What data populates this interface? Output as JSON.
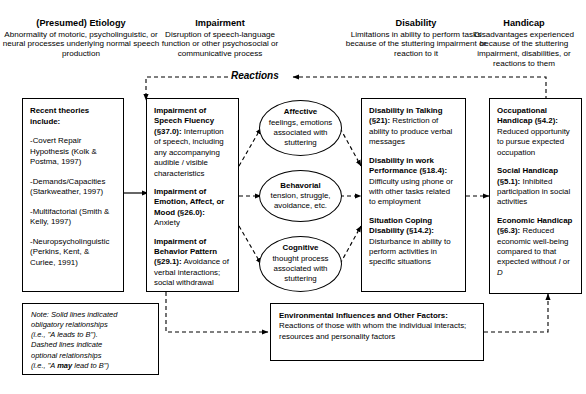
{
  "diagram": {
    "reactions_label": "Reactions",
    "columns": [
      {
        "id": "etiology",
        "title": "(Presumed) Etiology",
        "subtitle": "Abnormality of motoric, psycholinguistic, or neural processes underlying normal speech production"
      },
      {
        "id": "impairment",
        "title": "Impairment",
        "subtitle": "Disruption of speech-language function or other psychosocial or communicative process"
      },
      {
        "id": "disability",
        "title": "Disability",
        "subtitle": "Limitations in ability to perform tasks because of the stuttering impairment or reaction to it"
      },
      {
        "id": "handicap",
        "title": "Handicap",
        "subtitle": "Disadvantages experienced because of the stuttering impairment, disabilities, or reactions to them"
      }
    ],
    "etiology_box": {
      "heading": "Recent theories include:",
      "items": [
        "-Covert Repair Hypothesis (Kolk & Postma, 1997)",
        "-Demands/Capacities (Starkweather, 1997)",
        "-Multifactorial (Smith & Kelly, 1997)",
        "-Neuropsycholinguistic (Perkins, Kent, & Curlee, 1991)"
      ]
    },
    "impairment_box": {
      "entries": [
        {
          "label": "Impairment of Speech Fluency (§37.0):",
          "text": " Interruption of speech, including any accompanying audible / visible characteristics"
        },
        {
          "label": "Impairment of Emotion, Affect, or Mood (§26.0):",
          "text": " Anxiety"
        },
        {
          "label": "Impairment of Behavior Pattern (§29.1):",
          "text": " Avoidance of verbal interactions; social withdrawal"
        }
      ]
    },
    "ovals": [
      {
        "title": "Affective",
        "text": "feelings, emotions associated with stuttering"
      },
      {
        "title": "Behavorial",
        "text": "tension, struggle, avoidance, etc."
      },
      {
        "title": "Cognitive",
        "text": "thought process associated with stuttering"
      }
    ],
    "disability_box": {
      "entries": [
        {
          "label": "Disability in Talking (§21):",
          "text": " Restriction of ability to produce verbal messages"
        },
        {
          "label": "Disability in work Performance (§18.4):",
          "text": " Difficulty using phone or with other tasks related to employment"
        },
        {
          "label": "Situation Coping Disability (§14.2):",
          "text": " Disturbance in ability to perform activities in specific situations"
        }
      ]
    },
    "handicap_box": {
      "entries": [
        {
          "label": "Occupational Handicap (§4.2):",
          "text": " Reduced opportunity to pursue expected occupation"
        },
        {
          "label": "Social Handicap (§5.1):",
          "text": " Inhibited participation in social activities"
        },
        {
          "label": "Economic Handicap (§6.3):",
          "text": " Reduced economic well-being compared to that expected without I or D"
        }
      ]
    },
    "environment_box": {
      "label": "Environmental Influences and Other Factors:",
      "text": " Reactions of those with whom the individual interacts; resources and personality factors"
    },
    "note_box": {
      "lines": [
        "Note: Solid lines indicated",
        "obligatory relationships",
        "(i.e., \"A leads to B\").",
        "Dashed lines indicate",
        "optional relationships",
        "(i.e., \"A may lead to B\")"
      ],
      "emphasis_word": "may"
    },
    "colors": {
      "stroke": "#000000",
      "background": "#ffffff"
    }
  }
}
